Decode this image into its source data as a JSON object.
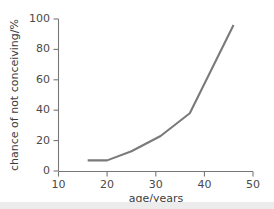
{
  "chart_data": {
    "type": "line",
    "title": "",
    "xlabel": "age/years",
    "ylabel": "chance of not conceiving/%",
    "xlim": [
      10,
      50
    ],
    "ylim": [
      0,
      100
    ],
    "xticks": [
      10,
      20,
      30,
      40,
      50
    ],
    "yticks": [
      0,
      20,
      40,
      60,
      80,
      100
    ],
    "grid": false,
    "legend": "none",
    "series": [
      {
        "name": "chance of not conceiving",
        "color": "#7a7a7a",
        "x": [
          16,
          20,
          25,
          31,
          37,
          46
        ],
        "values": [
          7,
          7,
          13,
          23,
          38,
          96
        ]
      }
    ]
  },
  "axes": {
    "x_tick_labels": [
      "10",
      "20",
      "30",
      "40",
      "50"
    ],
    "y_tick_labels": [
      "0",
      "20",
      "40",
      "60",
      "80",
      "100"
    ],
    "x_axis_title": "age/years",
    "y_axis_title": "chance of not conceiving/%"
  },
  "colors": {
    "series": "#7a7a7a",
    "axis": "#777777",
    "text": "#3c3c3c",
    "background": "#ffffff",
    "bottom_band": "#ececec"
  }
}
